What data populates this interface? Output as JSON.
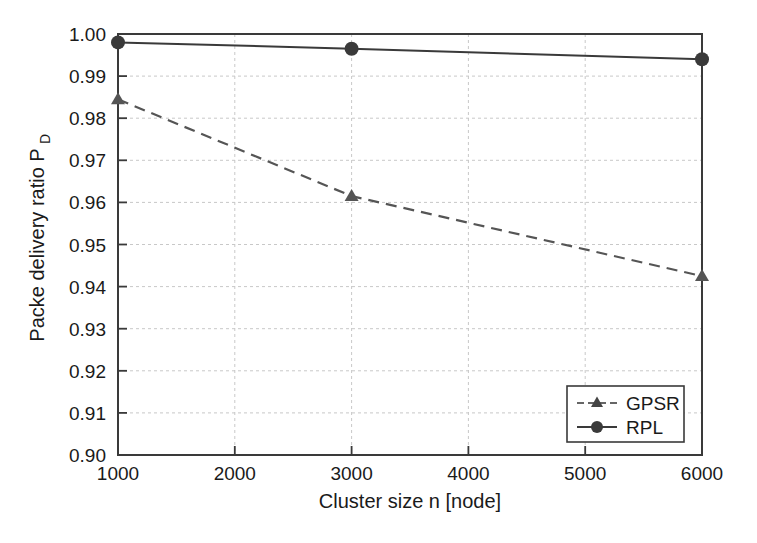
{
  "chart_data": {
    "type": "line",
    "title": "",
    "xlabel": "Cluster size n [node]",
    "ylabel": "Packe delivery ratio P",
    "ylabel_subscript": "D",
    "x": [
      1000,
      3000,
      6000
    ],
    "xlim": [
      1000,
      6000
    ],
    "ylim": [
      0.9,
      1.0
    ],
    "xticks": [
      1000,
      2000,
      3000,
      4000,
      5000,
      6000
    ],
    "xtick_labels": [
      "1000",
      "2000",
      "3000",
      "4000",
      "5000",
      "6000"
    ],
    "yticks": [
      0.9,
      0.91,
      0.92,
      0.93,
      0.94,
      0.95,
      0.96,
      0.97,
      0.98,
      0.99,
      1.0
    ],
    "ytick_labels": [
      "0.90",
      "0.91",
      "0.92",
      "0.93",
      "0.94",
      "0.95",
      "0.96",
      "0.97",
      "0.98",
      "0.99",
      "1.00"
    ],
    "grid": true,
    "grid_style": "dotted",
    "legend_position": "lower right",
    "series": [
      {
        "name": "GPSR",
        "values": [
          0.9845,
          0.9615,
          0.9425
        ],
        "marker": "triangle",
        "linestyle": "dashed",
        "color": "#555555"
      },
      {
        "name": "RPL",
        "values": [
          0.998,
          0.9965,
          0.994
        ],
        "marker": "circle",
        "linestyle": "solid",
        "color": "#3a3a3a"
      }
    ]
  },
  "legend": {
    "entries": [
      {
        "label": "GPSR"
      },
      {
        "label": "RPL"
      }
    ]
  },
  "colors": {
    "background": "#ffffff",
    "axis": "#3a3a3a",
    "grid": "#c8c8c8",
    "gpsr": "#555555",
    "rpl": "#3a3a3a",
    "text": "#1a1a1a"
  }
}
